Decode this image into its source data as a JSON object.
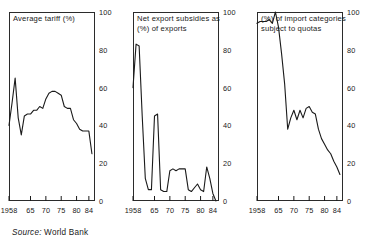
{
  "figure": {
    "source_label": "Source:",
    "source_value": "World Bank",
    "axis": {
      "y_ticks": [
        0,
        20,
        40,
        60,
        80,
        100
      ],
      "y_tick_labels": [
        "0",
        "20",
        "40",
        "60",
        "80",
        "100"
      ],
      "ylim": [
        0,
        100
      ],
      "x_ticks": [
        1958,
        1965,
        1970,
        1975,
        1980,
        1984
      ],
      "x_tick_labels": [
        "1958",
        "65",
        "70",
        "75",
        "80",
        "84"
      ],
      "xlim": [
        1958,
        1986
      ],
      "grid": false,
      "legend": "none",
      "line_color": "#1a1a1a"
    }
  },
  "chart_data": [
    {
      "type": "line",
      "title": "Average tariff (%)",
      "xlabel": "",
      "ylabel": "",
      "ylim": [
        0,
        100
      ],
      "xlim": [
        1958,
        1986
      ],
      "x": [
        1958,
        1959,
        1960,
        1961,
        1962,
        1963,
        1964,
        1965,
        1966,
        1967,
        1968,
        1969,
        1970,
        1971,
        1972,
        1973,
        1974,
        1975,
        1976,
        1977,
        1978,
        1979,
        1980,
        1981,
        1982,
        1983,
        1984,
        1985
      ],
      "values": [
        40,
        52,
        65,
        44,
        35,
        45,
        46,
        46,
        48,
        48,
        50,
        49,
        54,
        57,
        58,
        58,
        57,
        56,
        50,
        49,
        49,
        43,
        41,
        38,
        37,
        37,
        37,
        25
      ]
    },
    {
      "type": "line",
      "title": "Net export subsidies as\n(%) of exports",
      "xlabel": "",
      "ylabel": "",
      "ylim": [
        0,
        100
      ],
      "xlim": [
        1958,
        1986
      ],
      "x": [
        1958,
        1959,
        1960,
        1961,
        1962,
        1963,
        1964,
        1965,
        1966,
        1967,
        1968,
        1969,
        1970,
        1971,
        1972,
        1973,
        1974,
        1975,
        1976,
        1977,
        1978,
        1979,
        1980,
        1981,
        1982,
        1983,
        1984,
        1985
      ],
      "values": [
        60,
        83,
        82,
        45,
        12,
        6,
        6,
        45,
        46,
        6,
        5,
        5,
        16,
        17,
        16,
        17,
        17,
        17,
        6,
        5,
        7,
        9,
        6,
        5,
        18,
        12,
        4,
        0
      ]
    },
    {
      "type": "line",
      "title": "(%) of import categories\nsubject to quotas",
      "xlabel": "",
      "ylabel": "",
      "ylim": [
        0,
        100
      ],
      "xlim": [
        1958,
        1986
      ],
      "x": [
        1958,
        1959,
        1960,
        1961,
        1962,
        1963,
        1964,
        1965,
        1966,
        1967,
        1968,
        1969,
        1970,
        1971,
        1972,
        1973,
        1974,
        1975,
        1976,
        1977,
        1978,
        1979,
        1980,
        1981,
        1982,
        1983,
        1984,
        1985
      ],
      "values": [
        94,
        95,
        95,
        95,
        96,
        94,
        100,
        92,
        78,
        62,
        38,
        44,
        48,
        43,
        48,
        44,
        49,
        50,
        47,
        46,
        38,
        33,
        30,
        27,
        25,
        21,
        18,
        14
      ]
    }
  ]
}
